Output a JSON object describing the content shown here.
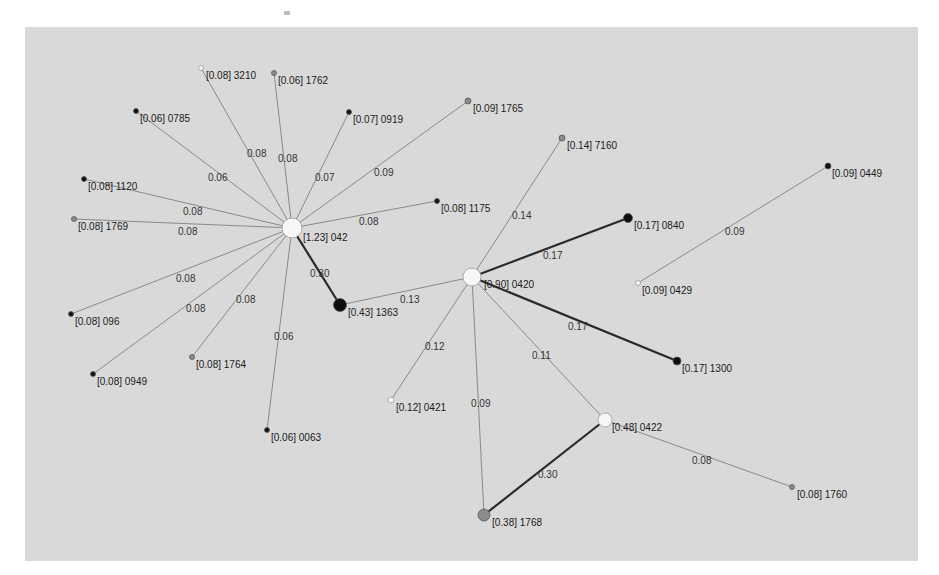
{
  "figure": {
    "type": "weighted network graph (star topology, two hubs)",
    "background": "#d9d9d9",
    "nodes": [
      {
        "id": "042",
        "label": "[1.23] 042",
        "weight": 1.23,
        "x": 292,
        "y": 228,
        "r": 10,
        "fill": "#f7f7f7",
        "lx": 303,
        "ly": 241
      },
      {
        "id": "3210",
        "label": "[0.08] 3210",
        "weight": 0.08,
        "x": 201,
        "y": 68,
        "r": 2.5,
        "fill": "#f7f7f7",
        "lx": 206,
        "ly": 79
      },
      {
        "id": "1762",
        "label": "[0.06] 1762",
        "weight": 0.06,
        "x": 274,
        "y": 73,
        "r": 2.5,
        "fill": "#8c8c8c",
        "lx": 278,
        "ly": 84
      },
      {
        "id": "0785",
        "label": "[0.06] 0785",
        "weight": 0.06,
        "x": 136,
        "y": 111,
        "r": 2.5,
        "fill": "#111111",
        "lx": 140,
        "ly": 122
      },
      {
        "id": "0919",
        "label": "[0.07] 0919",
        "weight": 0.07,
        "x": 349,
        "y": 112,
        "r": 2.5,
        "fill": "#111111",
        "lx": 353,
        "ly": 123
      },
      {
        "id": "1765",
        "label": "[0.09] 1765",
        "weight": 0.09,
        "x": 468,
        "y": 101,
        "r": 3,
        "fill": "#8c8c8c",
        "lx": 473,
        "ly": 112
      },
      {
        "id": "1120",
        "label": "[0.08] 1120",
        "weight": 0.08,
        "x": 84,
        "y": 179,
        "r": 2.5,
        "fill": "#111111",
        "lx": 88,
        "ly": 190
      },
      {
        "id": "1769",
        "label": "[0.08] 1769",
        "weight": 0.08,
        "x": 74,
        "y": 219,
        "r": 2.5,
        "fill": "#8c8c8c",
        "lx": 78,
        "ly": 230
      },
      {
        "id": "1175",
        "label": "[0.08] 1175",
        "weight": 0.08,
        "x": 437,
        "y": 201,
        "r": 2.5,
        "fill": "#111111",
        "lx": 441,
        "ly": 212
      },
      {
        "id": "096",
        "label": "[0.08] 096",
        "weight": 0.08,
        "x": 71,
        "y": 314,
        "r": 2.5,
        "fill": "#111111",
        "lx": 75,
        "ly": 325
      },
      {
        "id": "0949",
        "label": "[0.08] 0949",
        "weight": 0.08,
        "x": 93,
        "y": 374,
        "r": 2.5,
        "fill": "#111111",
        "lx": 97,
        "ly": 385
      },
      {
        "id": "1764",
        "label": "[0.08] 1764",
        "weight": 0.08,
        "x": 192,
        "y": 357,
        "r": 2.5,
        "fill": "#8c8c8c",
        "lx": 196,
        "ly": 368
      },
      {
        "id": "0063",
        "label": "[0.06] 0063",
        "weight": 0.06,
        "x": 267,
        "y": 430,
        "r": 2.5,
        "fill": "#111111",
        "lx": 271,
        "ly": 441
      },
      {
        "id": "1363",
        "label": "[0.43] 1363",
        "weight": 0.43,
        "x": 340,
        "y": 305,
        "r": 6.5,
        "fill": "#0d0d0d",
        "lx": 348,
        "ly": 316
      },
      {
        "id": "0420",
        "label": "[0.90] 0420",
        "weight": 0.9,
        "x": 472,
        "y": 277,
        "r": 9,
        "fill": "#f7f7f7",
        "lx": 484,
        "ly": 288
      },
      {
        "id": "7160",
        "label": "[0.14] 7160",
        "weight": 0.14,
        "x": 562,
        "y": 138,
        "r": 3,
        "fill": "#8c8c8c",
        "lx": 567,
        "ly": 149
      },
      {
        "id": "0840",
        "label": "[0.17] 0840",
        "weight": 0.17,
        "x": 628,
        "y": 218,
        "r": 4.5,
        "fill": "#0d0d0d",
        "lx": 634,
        "ly": 229
      },
      {
        "id": "0449",
        "label": "[0.09] 0449",
        "weight": 0.09,
        "x": 828,
        "y": 166,
        "r": 3,
        "fill": "#111111",
        "lx": 832,
        "ly": 177
      },
      {
        "id": "0429",
        "label": "[0.09] 0429",
        "weight": 0.09,
        "x": 638,
        "y": 283,
        "r": 2.5,
        "fill": "#f7f7f7",
        "lx": 642,
        "ly": 294
      },
      {
        "id": "1300",
        "label": "[0.17] 1300",
        "weight": 0.17,
        "x": 677,
        "y": 361,
        "r": 4,
        "fill": "#0d0d0d",
        "lx": 682,
        "ly": 372
      },
      {
        "id": "0421",
        "label": "[0.12] 0421",
        "weight": 0.12,
        "x": 391,
        "y": 400,
        "r": 3,
        "fill": "#f7f7f7",
        "lx": 396,
        "ly": 411
      },
      {
        "id": "0422",
        "label": "[0.48] 0422",
        "weight": 0.48,
        "x": 605,
        "y": 420,
        "r": 7,
        "fill": "#f7f7f7",
        "lx": 612,
        "ly": 431
      },
      {
        "id": "1768",
        "label": "[0.38] 1768",
        "weight": 0.38,
        "x": 484,
        "y": 515,
        "r": 6,
        "fill": "#8c8c8c",
        "lx": 492,
        "ly": 526
      },
      {
        "id": "1760",
        "label": "[0.08] 1760",
        "weight": 0.08,
        "x": 792,
        "y": 487,
        "r": 2.5,
        "fill": "#8c8c8c",
        "lx": 797,
        "ly": 498
      }
    ],
    "edges": [
      {
        "from": "042",
        "to": "3210",
        "weight": "0.08",
        "lx": 247,
        "ly": 157,
        "strong": false
      },
      {
        "from": "042",
        "to": "1762",
        "weight": "0.08",
        "lx": 278,
        "ly": 162,
        "strong": false
      },
      {
        "from": "042",
        "to": "0785",
        "weight": "0.06",
        "lx": 208,
        "ly": 181,
        "strong": false
      },
      {
        "from": "042",
        "to": "0919",
        "weight": "0.07",
        "lx": 315,
        "ly": 181,
        "strong": false
      },
      {
        "from": "042",
        "to": "1765",
        "weight": "0.09",
        "lx": 374,
        "ly": 176,
        "strong": false
      },
      {
        "from": "042",
        "to": "1120",
        "weight": "0.08",
        "lx": 183,
        "ly": 215,
        "strong": false
      },
      {
        "from": "042",
        "to": "1769",
        "weight": "0.08",
        "lx": 178,
        "ly": 235,
        "strong": false
      },
      {
        "from": "042",
        "to": "1175",
        "weight": "0.08",
        "lx": 359,
        "ly": 225,
        "strong": false
      },
      {
        "from": "042",
        "to": "096",
        "weight": "0.08",
        "lx": 176,
        "ly": 282,
        "strong": false
      },
      {
        "from": "042",
        "to": "0949",
        "weight": "0.08",
        "lx": 186,
        "ly": 312,
        "strong": false
      },
      {
        "from": "042",
        "to": "1764",
        "weight": "0.08",
        "lx": 236,
        "ly": 303,
        "strong": false
      },
      {
        "from": "042",
        "to": "0063",
        "weight": "0.06",
        "lx": 274,
        "ly": 340,
        "strong": false
      },
      {
        "from": "042",
        "to": "1363",
        "weight": "0.30",
        "lx": 310,
        "ly": 277,
        "strong": true
      },
      {
        "from": "1363",
        "to": "0420",
        "weight": "0.13",
        "lx": 400,
        "ly": 303,
        "strong": false
      },
      {
        "from": "0420",
        "to": "7160",
        "weight": "0.14",
        "lx": 512,
        "ly": 219,
        "strong": false
      },
      {
        "from": "0420",
        "to": "0840",
        "weight": "0.17",
        "lx": 543,
        "ly": 259,
        "strong": true
      },
      {
        "from": "0420",
        "to": "1300",
        "weight": "0.17",
        "lx": 568,
        "ly": 330,
        "strong": true
      },
      {
        "from": "0420",
        "to": "0421",
        "weight": "0.12",
        "lx": 425,
        "ly": 350,
        "strong": false
      },
      {
        "from": "0420",
        "to": "0422",
        "weight": "0.11",
        "lx": 532,
        "ly": 359,
        "strong": false
      },
      {
        "from": "0420",
        "to": "1768",
        "weight": "0.09",
        "lx": 471,
        "ly": 407,
        "strong": false
      },
      {
        "from": "0422",
        "to": "1768",
        "weight": "0.30",
        "lx": 538,
        "ly": 478,
        "strong": true
      },
      {
        "from": "0422",
        "to": "1760",
        "weight": "0.08",
        "lx": 692,
        "ly": 464,
        "strong": false
      },
      {
        "from": "0429",
        "to": "0449",
        "weight": "0.09",
        "lx": 725,
        "ly": 235,
        "strong": false
      }
    ]
  }
}
